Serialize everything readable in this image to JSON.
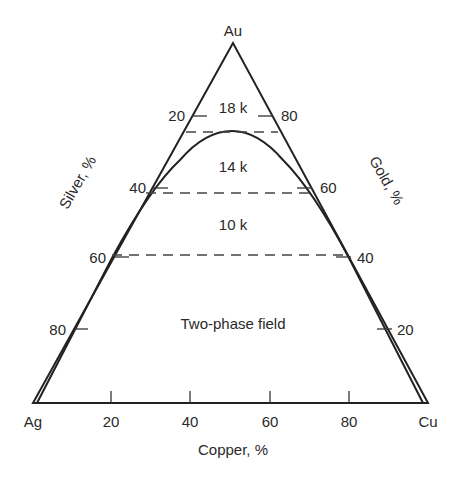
{
  "diagram": {
    "type": "ternary phase diagram",
    "vertices": {
      "top": "Au",
      "left": "Ag",
      "right": "Cu"
    },
    "axes": {
      "bottom": {
        "label": "Copper, %",
        "ticks": [
          "20",
          "40",
          "60",
          "80"
        ]
      },
      "left": {
        "label": "Silver, %",
        "ticks": [
          "20",
          "40",
          "60",
          "80"
        ]
      },
      "right": {
        "label": "Gold, %",
        "ticks": [
          "80",
          "60",
          "40",
          "20"
        ]
      }
    },
    "regions": {
      "k18": "18 k",
      "k14": "14 k",
      "k10": "10 k",
      "two_phase": "Two-phase field"
    },
    "karat_lines_gold_percent": [
      75,
      58.3,
      41.7
    ],
    "boundary": "miscibility gap curve peaking near 75% Au, ~50% Cu relative"
  }
}
